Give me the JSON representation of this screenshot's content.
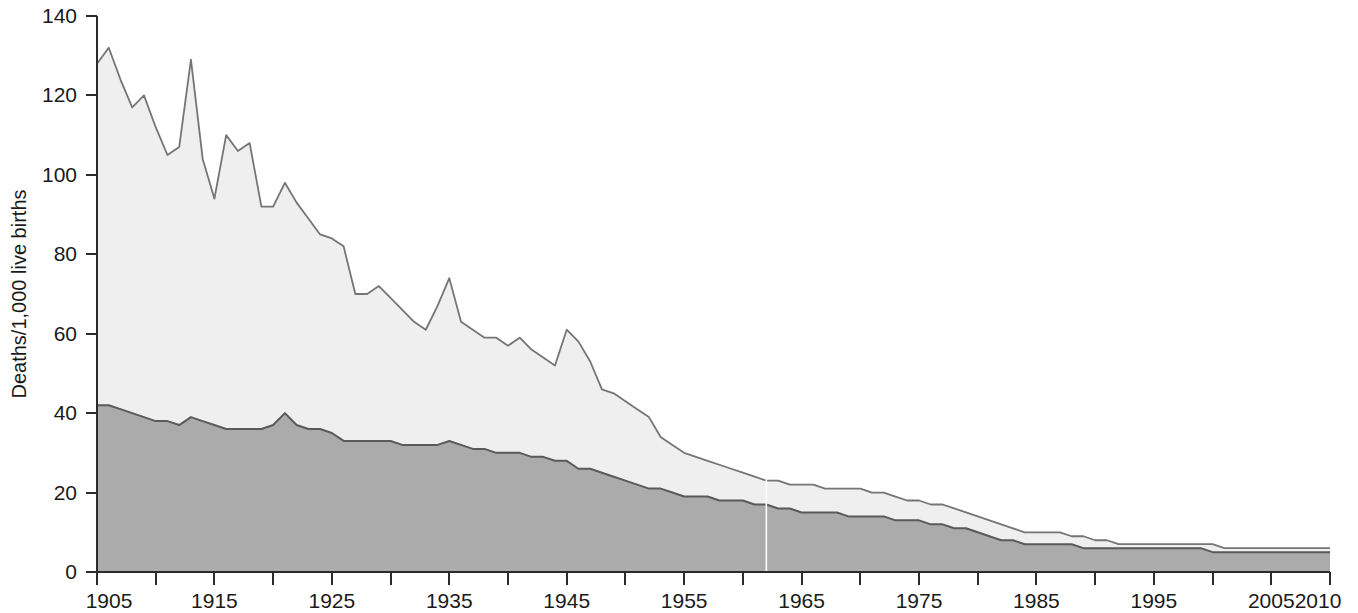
{
  "chart_data": {
    "type": "area",
    "title": "",
    "subtitle": "",
    "xlabel": "",
    "ylabel": "Deaths/1,000 live births",
    "xlim": [
      1905,
      2010
    ],
    "ylim": [
      0,
      140
    ],
    "ytick_values": [
      0,
      20,
      40,
      60,
      80,
      100,
      120,
      140
    ],
    "ytick_labels": [
      "0",
      "20",
      "40",
      "60",
      "80",
      "100",
      "120",
      "140"
    ],
    "xtick_values": [
      1905,
      1910,
      1915,
      1920,
      1925,
      1930,
      1935,
      1940,
      1945,
      1950,
      1955,
      1960,
      1965,
      1970,
      1975,
      1980,
      1985,
      1990,
      1995,
      2000,
      2005,
      2010
    ],
    "xtick_labels": [
      "1905",
      "",
      "1915",
      "",
      "1925",
      "",
      "1935",
      "",
      "1945",
      "",
      "1955",
      "",
      "1965",
      "",
      "1975",
      "",
      "1985",
      "",
      "1995",
      "",
      "2005",
      "2010"
    ],
    "grid": false,
    "legend_position": "none",
    "stacking": "overlaid-cumulative",
    "colors": {
      "upper_band_fill": "#efefef",
      "lower_band_fill": "#ababab",
      "upper_line": "#757575",
      "lower_line": "#5a5a5a",
      "axis": "#2b2b2b",
      "text": "#1a1a1a",
      "background": "#ffffff"
    },
    "x": [
      1905,
      1906,
      1907,
      1908,
      1909,
      1910,
      1911,
      1912,
      1913,
      1914,
      1915,
      1916,
      1917,
      1918,
      1919,
      1920,
      1921,
      1922,
      1923,
      1924,
      1925,
      1926,
      1927,
      1928,
      1929,
      1930,
      1931,
      1932,
      1933,
      1934,
      1935,
      1936,
      1937,
      1938,
      1939,
      1940,
      1941,
      1942,
      1943,
      1944,
      1945,
      1946,
      1947,
      1948,
      1949,
      1950,
      1951,
      1952,
      1953,
      1954,
      1955,
      1956,
      1957,
      1958,
      1959,
      1960,
      1961,
      1962,
      1963,
      1964,
      1965,
      1966,
      1967,
      1968,
      1969,
      1970,
      1971,
      1972,
      1973,
      1974,
      1975,
      1976,
      1977,
      1978,
      1979,
      1980,
      1981,
      1982,
      1983,
      1984,
      1985,
      1986,
      1987,
      1988,
      1989,
      1990,
      1991,
      1992,
      1993,
      1994,
      1995,
      1996,
      1997,
      1998,
      1999,
      2000,
      2001,
      2002,
      2003,
      2004,
      2005,
      2006,
      2007,
      2008,
      2009,
      2010
    ],
    "series": [
      {
        "name": "Total infant mortality (upper boundary)",
        "role": "total",
        "values": [
          128,
          132,
          124,
          117,
          120,
          112,
          105,
          107,
          129,
          104,
          94,
          110,
          106,
          108,
          92,
          92,
          98,
          93,
          89,
          85,
          84,
          82,
          70,
          70,
          72,
          69,
          66,
          63,
          61,
          67,
          74,
          63,
          61,
          59,
          59,
          57,
          59,
          56,
          54,
          52,
          61,
          58,
          53,
          46,
          45,
          43,
          41,
          39,
          34,
          32,
          30,
          29,
          28,
          27,
          26,
          25,
          24,
          23,
          23,
          22,
          22,
          22,
          21,
          21,
          21,
          21,
          20,
          20,
          19,
          18,
          18,
          17,
          17,
          16,
          15,
          14,
          13,
          12,
          11,
          10,
          10,
          10,
          10,
          9,
          9,
          8,
          8,
          7,
          7,
          7,
          7,
          7,
          7,
          7,
          7,
          7,
          6,
          6,
          6,
          6,
          6,
          6,
          6,
          6,
          6,
          6
        ]
      },
      {
        "name": "Neonatal / lower band (inner boundary)",
        "role": "lower",
        "values": [
          42,
          42,
          41,
          40,
          39,
          38,
          38,
          37,
          39,
          38,
          37,
          36,
          36,
          36,
          36,
          37,
          40,
          37,
          36,
          36,
          35,
          33,
          33,
          33,
          33,
          33,
          32,
          32,
          32,
          32,
          33,
          32,
          31,
          31,
          30,
          30,
          30,
          29,
          29,
          28,
          28,
          26,
          26,
          25,
          24,
          23,
          22,
          21,
          21,
          20,
          19,
          19,
          19,
          18,
          18,
          18,
          17,
          17,
          16,
          16,
          15,
          15,
          15,
          15,
          14,
          14,
          14,
          14,
          13,
          13,
          13,
          12,
          12,
          11,
          11,
          10,
          9,
          8,
          8,
          7,
          7,
          7,
          7,
          7,
          6,
          6,
          6,
          6,
          6,
          6,
          6,
          6,
          6,
          6,
          6,
          5,
          5,
          5,
          5,
          5,
          5,
          5,
          5,
          5,
          5,
          5
        ]
      }
    ],
    "annotations": [
      {
        "type": "vertical-line",
        "x": 1962,
        "color": "#ffffff",
        "note": "faint white vertical seam artifact"
      }
    ]
  },
  "plot_geometry": {
    "left": 97,
    "right": 1330,
    "top": 16,
    "bottom": 572
  }
}
